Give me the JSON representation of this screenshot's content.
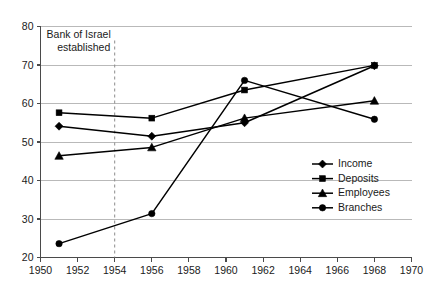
{
  "chart_data": {
    "type": "line",
    "title": "",
    "subtitle": "",
    "xlabel": "",
    "ylabel": "",
    "xlim": [
      1950,
      1970
    ],
    "ylim": [
      20,
      80
    ],
    "x_ticks": [
      1950,
      1952,
      1954,
      1956,
      1958,
      1960,
      1962,
      1964,
      1966,
      1968,
      1970
    ],
    "y_ticks": [
      20,
      30,
      40,
      50,
      60,
      70,
      80
    ],
    "grid": "horizontal",
    "legend_position": "center-right",
    "x": [
      1951,
      1956,
      1961,
      1968
    ],
    "series": [
      {
        "name": "Income",
        "marker": "diamond",
        "values": [
          54.1,
          51.5,
          55.0,
          69.8
        ]
      },
      {
        "name": "Deposits",
        "marker": "square",
        "values": [
          57.6,
          56.2,
          63.5,
          69.9
        ]
      },
      {
        "name": "Employees",
        "marker": "triangle",
        "values": [
          46.4,
          48.6,
          56.2,
          60.7
        ]
      },
      {
        "name": "Branches",
        "marker": "circle",
        "values": [
          23.6,
          31.4,
          66.0,
          55.9
        ]
      }
    ],
    "annotations": [
      {
        "text_line_1": "Bank of Israel",
        "text_line_2": "established",
        "x_value": 1954,
        "line_style": "dashed"
      }
    ],
    "colors": {
      "series": "#000000",
      "grid": "#b9b9b9",
      "axis": "#4a4a4a",
      "event_line": "#8c8c8c",
      "background": "#ffffff"
    }
  },
  "legend": {
    "entries": [
      {
        "label": "Income"
      },
      {
        "label": "Deposits"
      },
      {
        "label": "Employees"
      },
      {
        "label": "Branches"
      }
    ]
  }
}
